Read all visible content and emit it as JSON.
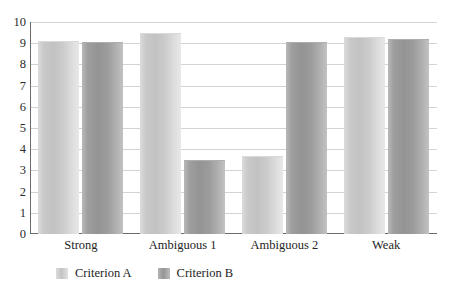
{
  "chart_data": {
    "type": "bar",
    "title": "",
    "subtitle": "",
    "xlabel": "",
    "ylabel": "",
    "categories": [
      "Strong",
      "Ambiguous 1",
      "Ambiguous 2",
      "Weak"
    ],
    "series": [
      {
        "name": "Criterion A",
        "color": "#c9c9c9",
        "values": [
          9.05,
          9.45,
          3.65,
          9.25
        ]
      },
      {
        "name": "Criterion B",
        "color": "#9a9a9a",
        "values": [
          9.0,
          3.45,
          9.0,
          9.15
        ]
      }
    ],
    "ylim": [
      0,
      10
    ],
    "yticks": [
      0,
      1,
      2,
      3,
      4,
      5,
      6,
      7,
      8,
      9,
      10
    ],
    "ytick_labels": [
      "0",
      "1",
      "2",
      "3",
      "4",
      "5",
      "6",
      "7",
      "8",
      "9",
      "10"
    ],
    "grid": true,
    "grid_axis": "y",
    "legend": {
      "position": "bottom",
      "entries": [
        {
          "label": "Criterion A",
          "swatch": "legend-swatch-criterion-a"
        },
        {
          "label": "Criterion B",
          "swatch": "legend-swatch-criterion-b"
        }
      ]
    },
    "axis_color": "#6b6b6b",
    "grid_color": "#d3d3d3",
    "background": "#ffffff"
  }
}
